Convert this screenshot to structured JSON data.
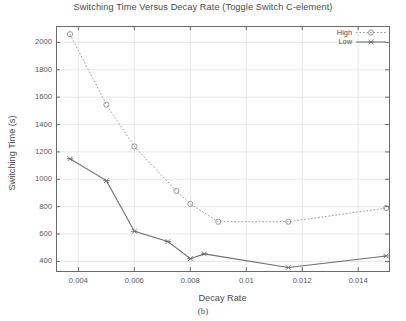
{
  "chart_data": {
    "type": "line",
    "title": "Switching Time Versus Decay Rate (Toggle Switch C-element)",
    "xlabel": "Decay Rate",
    "ylabel": "Switching Time (s)",
    "caption": "(b)",
    "xlim": [
      0.0032,
      0.0151
    ],
    "ylim": [
      330,
      2120
    ],
    "xticks": [
      0.004,
      0.006,
      0.008,
      0.01,
      0.012,
      0.014
    ],
    "xtick_labels": [
      "0.004",
      "0.006",
      "0.008",
      "0.01",
      "0.012",
      "0.014"
    ],
    "yticks": [
      400,
      600,
      800,
      1000,
      1200,
      1400,
      1600,
      1800,
      2000
    ],
    "ytick_labels": [
      "400",
      "600",
      "800",
      "1000",
      "1200",
      "1400",
      "1600",
      "1800",
      "2000"
    ],
    "grid": true,
    "legend_position": "top-right",
    "series": [
      {
        "name": "High",
        "marker": "circle",
        "linestyle": "dotted",
        "color": "#8c8c8c",
        "x": [
          0.0037,
          0.005,
          0.006,
          0.0075,
          0.008,
          0.009,
          0.0115,
          0.015
        ],
        "y": [
          2060,
          1545,
          1240,
          915,
          820,
          690,
          690,
          790
        ]
      },
      {
        "name": "Low",
        "marker": "cross",
        "linestyle": "solid",
        "color": "#6e6e6e",
        "x": [
          0.0037,
          0.005,
          0.006,
          0.0072,
          0.008,
          0.0085,
          0.0115,
          0.015
        ],
        "y": [
          1150,
          990,
          620,
          545,
          420,
          455,
          355,
          440
        ]
      }
    ]
  },
  "legend": {
    "items": [
      {
        "label": "High"
      },
      {
        "label": "Low"
      }
    ]
  },
  "plot_frame": {
    "left": 56,
    "top": 26,
    "right": 389,
    "bottom": 271
  },
  "colors": {
    "axis": "#6b6b6b",
    "grid": "#e2e2e2",
    "text": "#4a4a4a",
    "high_series": "#8c8c8c",
    "low_series": "#6e6e6e"
  }
}
